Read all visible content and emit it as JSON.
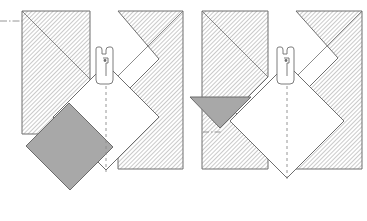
{
  "diagram": {
    "page_width": 367,
    "page_height": 221,
    "background_color": "#ffffff",
    "colors": {
      "outline": "#6e6e6e",
      "outline_dark": "#555555",
      "hatch_line": "#7a7a7a",
      "shaded_fill": "#a8a8a8",
      "shaded_stroke": "#6b6b6b",
      "centerline": "#8a8a8a",
      "white_fill": "#ffffff"
    },
    "line_styles": {
      "solid": "none",
      "dashed": "3,3",
      "dash_dot": "7,2,1.5,2"
    },
    "hatch": {
      "angle_deg": 45,
      "spacing_px": 3,
      "stroke_width": 0.7,
      "description": "fine 45-degree section hatching"
    },
    "figures": [
      {
        "id": "figure-left",
        "label": "left-assembly",
        "state": "panel-rotated-open",
        "origin_x": 0,
        "centerline_x": 106,
        "shaded_element": {
          "name": "shaded-panel",
          "shape": "rotated-rectangle",
          "fill": "#a8a8a8",
          "rotation_deg": 45,
          "position": "lower-left",
          "points": "26,146 69,103 113,147 70,190"
        },
        "hatched_blocks": [
          {
            "name": "hatched-block-left",
            "points": "22,11 90,11 90,100 56,134 22,134",
            "corner_diagonal": "22,11 90,79"
          },
          {
            "name": "hatched-block-right",
            "points": "118,11 183,11 183,169 118,169 118,100 159,59",
            "corner_diagonal": "183,11 118,76"
          }
        ],
        "white_panel": {
          "name": "rotated-square-panel",
          "points": "106,64 159,117 106,170 53,117"
        },
        "centerline": {
          "name": "vertical-centerline",
          "x1": 106,
          "y1": 62,
          "x2": 106,
          "y2": 172,
          "style": "dashed"
        },
        "reference_line": {
          "name": "horizontal-datum-line",
          "x1": 0,
          "y1": 21,
          "x2": 30,
          "y2": 21,
          "style": "dash_dot"
        },
        "clamp": {
          "name": "clamp-fixture",
          "center_x": 104,
          "top_y": 49,
          "bottom_y": 84,
          "width": 26
        }
      },
      {
        "id": "figure-right",
        "label": "right-assembly",
        "state": "panel-rotated-closed",
        "origin_x": 183,
        "centerline_x": 287,
        "shaded_element": {
          "name": "shaded-triangle",
          "shape": "triangle",
          "fill": "#a8a8a8",
          "position": "left-of-panel",
          "points": "190,97 251,97 220,128"
        },
        "hatched_blocks": [
          {
            "name": "hatched-block-left",
            "points": "202,11 268,11 268,77 234,111 268,145 268,169 202,169",
            "corner_diagonal": "202,11 268,77"
          },
          {
            "name": "hatched-block-right",
            "points": "296,11 362,11 362,169 296,169 296,100 338,58",
            "corner_diagonal": "362,11 296,77"
          }
        ],
        "white_panel": {
          "name": "rotated-square-panel",
          "points": "287,64 344,121 287,178 230,121"
        },
        "centerline": {
          "name": "vertical-centerline",
          "x1": 287,
          "y1": 62,
          "x2": 287,
          "y2": 180,
          "style": "dashed"
        },
        "reference_line": {
          "name": "horizontal-datum-line-short",
          "x1": 203,
          "y1": 132,
          "x2": 222,
          "y2": 132,
          "style": "dash_dot"
        },
        "clamp": {
          "name": "clamp-fixture",
          "center_x": 285,
          "top_y": 49,
          "bottom_y": 84,
          "width": 26
        }
      }
    ]
  }
}
